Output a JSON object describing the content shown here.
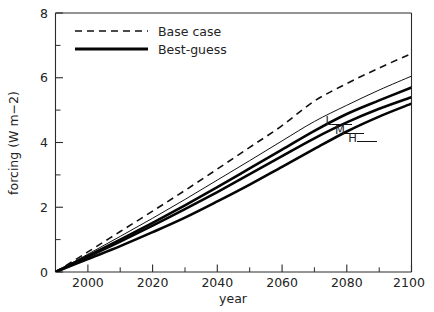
{
  "chart_data": {
    "type": "line",
    "title": "",
    "xlabel": "year",
    "ylabel": "forcing (W m-2)",
    "ylabel_display": "forcing (W m−2)",
    "xlim": [
      1990,
      2100
    ],
    "ylim": [
      0,
      8
    ],
    "grid": false,
    "legend_position": "top-left",
    "x_major_ticks": [
      2000,
      2020,
      2040,
      2060,
      2080,
      2100
    ],
    "x_major_tick_labels": [
      "2000",
      "2020",
      "2040",
      "2060",
      "2080",
      "2100"
    ],
    "x_minor_ticks": [
      1990,
      2010,
      2030,
      2050,
      2070,
      2090
    ],
    "y_major_ticks": [
      0,
      2,
      4,
      6,
      8
    ],
    "y_major_tick_labels": [
      "0",
      "2",
      "4",
      "6",
      "8"
    ],
    "y_minor_ticks": [
      1,
      3,
      5,
      7
    ],
    "x": [
      1990,
      2000,
      2010,
      2020,
      2030,
      2040,
      2050,
      2060,
      2070,
      2080,
      2090,
      2100
    ],
    "series": [
      {
        "name": "Base case",
        "style": "dashed",
        "label": "",
        "values": [
          0.0,
          0.62,
          1.25,
          1.88,
          2.52,
          3.18,
          3.85,
          4.52,
          5.28,
          5.82,
          6.3,
          6.75
        ]
      },
      {
        "name": "Upper thin",
        "style": "thin-solid",
        "label": "",
        "values": [
          0.0,
          0.55,
          1.1,
          1.66,
          2.24,
          2.84,
          3.44,
          4.05,
          4.65,
          5.15,
          5.62,
          6.05
        ]
      },
      {
        "name": "L",
        "style": "thick-solid",
        "label": "L",
        "values": [
          0.0,
          0.5,
          1.0,
          1.52,
          2.06,
          2.62,
          3.2,
          3.78,
          4.36,
          4.88,
          5.3,
          5.7
        ]
      },
      {
        "name": "M",
        "style": "thick-solid",
        "label": "M",
        "values": [
          0.0,
          0.47,
          0.94,
          1.43,
          1.94,
          2.47,
          3.02,
          3.58,
          4.13,
          4.62,
          5.04,
          5.4
        ]
      },
      {
        "name": "H",
        "style": "thick-solid",
        "label": "H",
        "values": [
          0.0,
          0.4,
          0.8,
          1.23,
          1.68,
          2.18,
          2.7,
          3.25,
          3.8,
          4.34,
          4.8,
          5.2
        ]
      }
    ],
    "legend": [
      {
        "label": "Base case",
        "style": "dashed"
      },
      {
        "label": "Best-guess",
        "style": "thick-solid"
      }
    ],
    "annotations": [
      {
        "text": "L",
        "x": 2080,
        "y": 4.55
      },
      {
        "text": "M",
        "x": 2086,
        "y": 4.3
      },
      {
        "text": "H",
        "x": 2092,
        "y": 4.08
      }
    ]
  }
}
